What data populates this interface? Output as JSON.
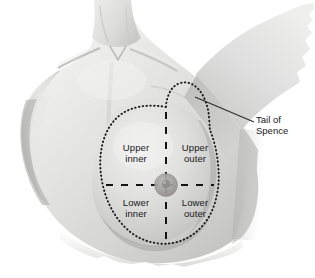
{
  "figure": {
    "width": 315,
    "height": 278,
    "background_color": "#ffffff",
    "style": "grayscale-medical-illustration"
  },
  "quadrants": [
    {
      "id": "upper-inner",
      "line1": "Upper",
      "line2": "inner"
    },
    {
      "id": "upper-outer",
      "line1": "Upper",
      "line2": "outer"
    },
    {
      "id": "lower-inner",
      "line1": "Lower",
      "line2": "inner"
    },
    {
      "id": "lower-outer",
      "line1": "Lower",
      "line2": "outer"
    }
  ],
  "annotation": {
    "id": "tail-of-spence",
    "line1": "Tail of",
    "line2": "Spence"
  },
  "colors": {
    "skin_light": "#ececeb",
    "skin_mid": "#dcdcda",
    "skin_shade": "#c6c6c4",
    "skin_dark": "#a9a9a7",
    "skin_deep": "#8e8e8c",
    "outline_dots": "#1a1a1a",
    "divider_dash": "#141414",
    "leader_line": "#2b2b2b",
    "text": "#18181a",
    "areola": "#a3a19c",
    "nipple": "#8a8884"
  },
  "markings": {
    "breast_outline": "dotted-teardrop-with-axillary-tail",
    "dividers": "dashed-vertical-and-horizontal-crosshair",
    "nipple_center_x": 166,
    "nipple_center_y": 185
  }
}
